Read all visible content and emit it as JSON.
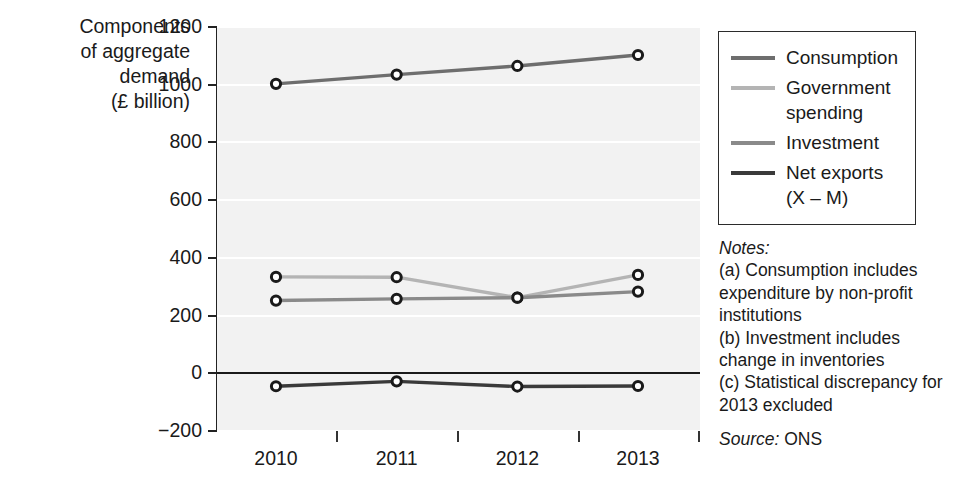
{
  "chart_data": {
    "type": "line",
    "title": "",
    "ylabel": "Components of aggregate demand (£ billion)",
    "xlabel": "",
    "categories": [
      "2010",
      "2011",
      "2012",
      "2013"
    ],
    "ylim": [
      -200,
      1200
    ],
    "ytick_step": 200,
    "yticks": [
      "1200",
      "1000",
      "800",
      "600",
      "400",
      "200",
      "0",
      "-200"
    ],
    "grid": true,
    "grid_orientation": "horizontal",
    "legend_position": "right",
    "series": [
      {
        "name": "Consumption",
        "color": "#6e6e6e",
        "values": [
          1003,
          1035,
          1065,
          1103
        ]
      },
      {
        "name": "Government spending",
        "color": "#b4b4b4",
        "values": [
          334,
          333,
          262,
          341
        ]
      },
      {
        "name": "Investment",
        "color": "#8a8a8a",
        "values": [
          252,
          258,
          262,
          283
        ]
      },
      {
        "name": "Net exports (X – M)",
        "color": "#3a3a3a",
        "values": [
          -45,
          -28,
          -46,
          -44
        ]
      }
    ]
  },
  "y_axis": {
    "title_line1": "Components",
    "title_line2": "of aggregate",
    "title_line3": "demand",
    "title_line4": "(£ billion)",
    "title_full": "Components\nof aggregate\ndemand\n(£ billion)"
  },
  "legend": {
    "items": [
      {
        "label": "Consumption",
        "color": "#6e6e6e"
      },
      {
        "label": "Government\nspending",
        "color": "#b4b4b4"
      },
      {
        "label": "Investment",
        "color": "#8a8a8a"
      },
      {
        "label": "Net exports\n(X – M)",
        "color": "#3a3a3a"
      }
    ]
  },
  "notes": {
    "heading": "Notes:",
    "items": [
      "(a) Consumption includes expenditure by non-profit institutions",
      "(b) Investment includes change in inventories",
      "(c) Statistical discrepancy for 2013 excluded"
    ],
    "source_label": "Source:",
    "source_value": "ONS"
  }
}
